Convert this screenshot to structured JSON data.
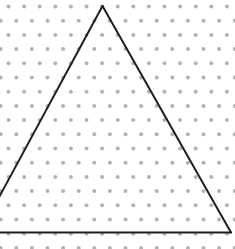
{
  "figure": {
    "background": "#ffffff"
  },
  "dot_grid": {
    "type": "isometric",
    "dot_color": "#b3b3b3",
    "dot_radius": 2,
    "spacing_x": 15.6,
    "spacing_y": 14.2,
    "origin_y": 6.5,
    "even_row_x_offset": 8.5,
    "odd_row_x_offset": 0.7,
    "rows": 18
  },
  "triangle": {
    "stroke_color": "#1e1e1e",
    "stroke_width": 2,
    "apex": [
      102.5,
      6
    ],
    "bottom_left": [
      -20,
      232.5
    ],
    "bottom_right": [
      231,
      232.5
    ]
  }
}
